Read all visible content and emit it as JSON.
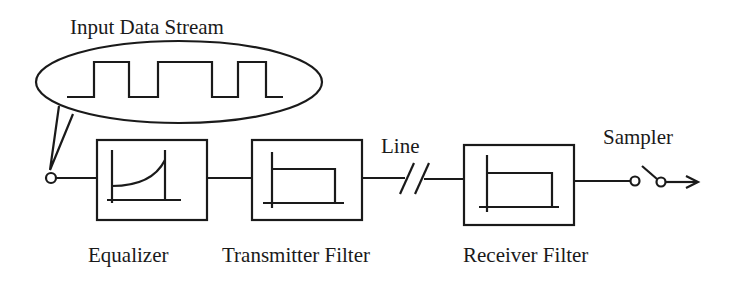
{
  "diagram": {
    "type": "block-diagram",
    "colors": {
      "stroke": "#1a1a1a",
      "background": "#ffffff"
    },
    "input": {
      "label": "Input Data Stream",
      "waveform": "square-pulse-train",
      "bits": [
        0,
        1,
        0,
        1,
        1,
        0,
        1,
        0
      ]
    },
    "blocks": [
      {
        "id": "equalizer",
        "label": "Equalizer",
        "response_icon": "rising-curve-response"
      },
      {
        "id": "transmitter-filter",
        "label": "Transmitter Filter",
        "response_icon": "lowpass-rect-response"
      },
      {
        "id": "receiver-filter",
        "label": "Receiver Filter",
        "response_icon": "lowpass-rect-response"
      }
    ],
    "channel": {
      "label": "Line",
      "symbol": "line-break-double-slash"
    },
    "output": {
      "label": "Sampler",
      "symbol": "switch-with-arrow"
    },
    "flow": [
      "input",
      "equalizer",
      "transmitter-filter",
      "line",
      "receiver-filter",
      "sampler"
    ]
  }
}
